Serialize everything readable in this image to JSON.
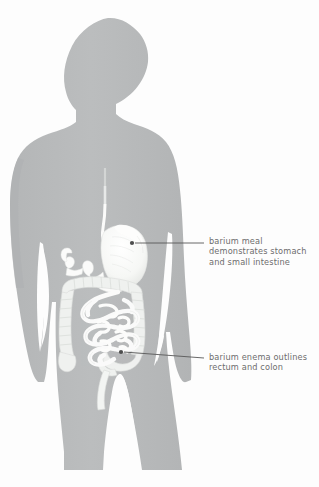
{
  "figure": {
    "background_color": "#fdfdfd",
    "silhouette_color": "#b8babb",
    "silhouette_shadow_color": "#acaeaf",
    "organ_fill_color": "#fbfbfa",
    "organ_shade_color": "#dcdedd",
    "leader_line_color": "#585858",
    "text_color": "#6d6d6d"
  },
  "annotations": [
    {
      "id": "barium-meal",
      "lines": [
        "barium meal",
        "demonstrates stomach",
        "and small intestine"
      ],
      "marker_point": {
        "x": 132,
        "y": 243
      },
      "leader_end": {
        "x": 204,
        "y": 243
      }
    },
    {
      "id": "barium-enema",
      "lines": [
        "barium enema outlines",
        "rectum and colon"
      ],
      "marker_point": {
        "x": 121,
        "y": 352
      },
      "leader_end": {
        "x": 204,
        "y": 358
      }
    }
  ],
  "anatomy_parts": [
    {
      "name": "esophagus"
    },
    {
      "name": "stomach"
    },
    {
      "name": "duodenum"
    },
    {
      "name": "small-intestine"
    },
    {
      "name": "ascending-colon"
    },
    {
      "name": "transverse-colon"
    },
    {
      "name": "descending-colon"
    },
    {
      "name": "sigmoid-colon"
    },
    {
      "name": "rectum"
    }
  ]
}
